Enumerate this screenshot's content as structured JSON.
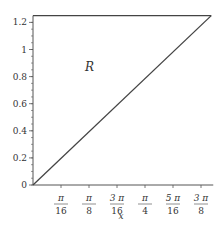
{
  "chart_data": {
    "type": "line",
    "title": "",
    "xlabel": "x",
    "ylabel": "",
    "region_label": "R",
    "xlim": [
      0,
      1.25
    ],
    "ylim": [
      0,
      1.25
    ],
    "grid": false,
    "legend": null,
    "x_ticks": [
      {
        "value": 0.19635,
        "num": "π",
        "den": "16"
      },
      {
        "value": 0.3927,
        "num": "π",
        "den": "8"
      },
      {
        "value": 0.58905,
        "num": "3 π",
        "den": "16"
      },
      {
        "value": 0.7854,
        "num": "π",
        "den": "4"
      },
      {
        "value": 0.98175,
        "num": "5 π",
        "den": "16"
      },
      {
        "value": 1.1781,
        "num": "3 π",
        "den": "8"
      }
    ],
    "y_ticks": [
      {
        "value": 0,
        "label": "0"
      },
      {
        "value": 0.2,
        "label": "0.2"
      },
      {
        "value": 0.4,
        "label": "0.4"
      },
      {
        "value": 0.6,
        "label": "0.6"
      },
      {
        "value": 0.8,
        "label": "0.8"
      },
      {
        "value": 1.0,
        "label": "1"
      },
      {
        "value": 1.2,
        "label": "1.2"
      }
    ],
    "series": [
      {
        "name": "y = x",
        "x": [
          0,
          1.25
        ],
        "y": [
          0,
          1.25
        ],
        "color": "#444444"
      },
      {
        "name": "y = 1.25",
        "x": [
          0,
          1.25
        ],
        "y": [
          1.25,
          1.25
        ],
        "color": "#444444"
      }
    ]
  }
}
